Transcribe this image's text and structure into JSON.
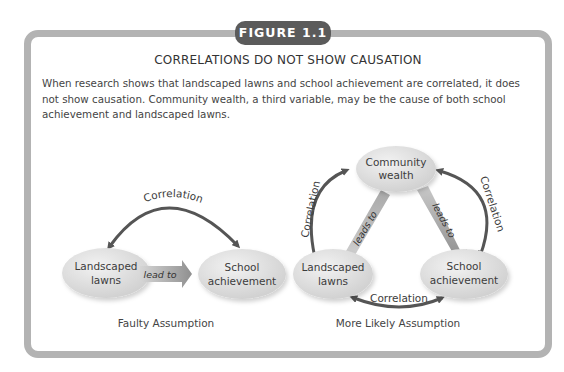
{
  "figure": {
    "tab_label": "FIGURE 1.1",
    "title": "CORRELATIONS DO NOT SHOW CAUSATION",
    "description": "When research shows that landscaped lawns and school achievement are correlated, it does not show causation. Community wealth, a third variable, may be the cause of both school achievement and landscaped lawns."
  },
  "diagrams": {
    "faulty": {
      "caption": "Faulty Assumption",
      "nodes": {
        "lawns": [
          "Landscaped",
          "lawns"
        ],
        "school": [
          "School",
          "achievement"
        ]
      },
      "arrow_label": "lead to",
      "correlation_label": "Correlation"
    },
    "likely": {
      "caption": "More Likely Assumption",
      "nodes": {
        "wealth": [
          "Community",
          "wealth"
        ],
        "lawns": [
          "Landscaped",
          "lawns"
        ],
        "school": [
          "School",
          "achievement"
        ]
      },
      "leads_left": "leads to",
      "leads_right": "leads to",
      "correlation_left": "Correlation",
      "correlation_right": "Correlation",
      "correlation_bottom": "Correlation"
    }
  },
  "colors": {
    "frame": "#b3b3b3",
    "tab": "#5b5b5b",
    "node_fill": "#d9d9d9",
    "arrow_dark": "#555555",
    "arrow_light": "#b8b8b8"
  }
}
